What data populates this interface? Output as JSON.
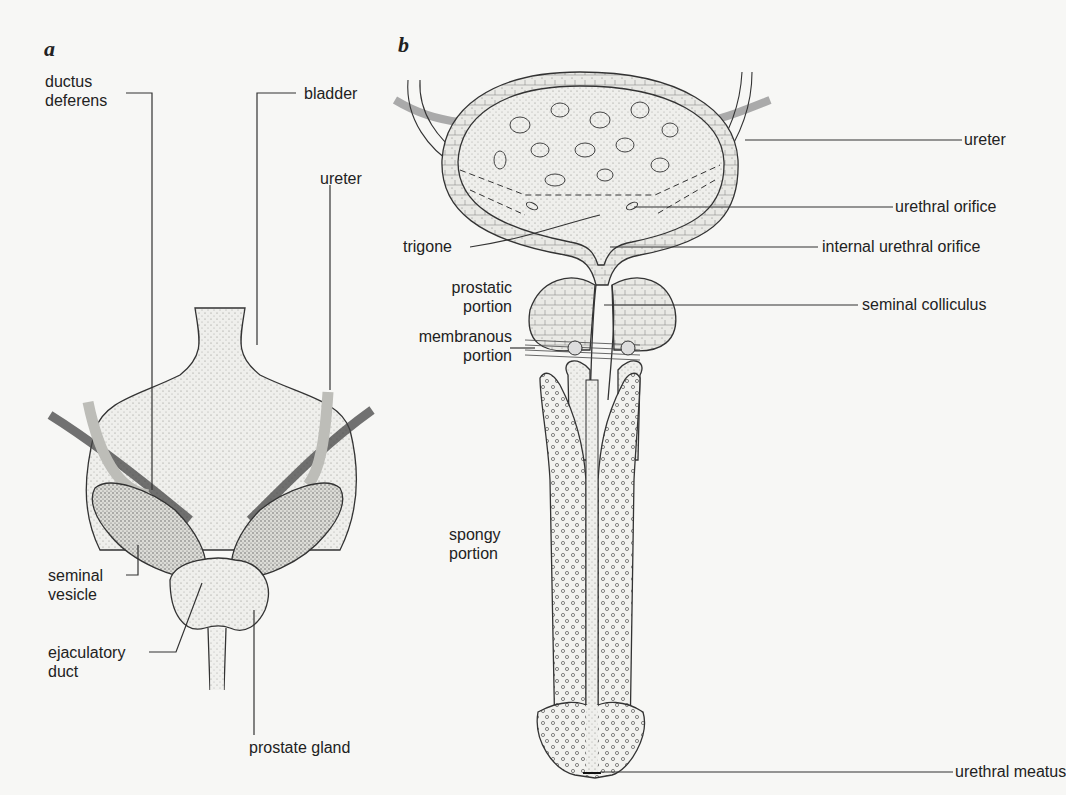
{
  "figure": {
    "panels": [
      {
        "id": "a",
        "letter": "a",
        "labels": {
          "ductus_deferens": [
            "ductus",
            "deferens"
          ],
          "bladder": "bladder",
          "ureter": "ureter",
          "seminal_vesicle": [
            "seminal",
            "vesicle"
          ],
          "ejaculatory_duct": [
            "ejaculatory",
            "duct"
          ],
          "prostate_gland": "prostate gland"
        }
      },
      {
        "id": "b",
        "letter": "b",
        "labels": {
          "ureter": "ureter",
          "urethral_orifice": "urethral orifice",
          "trigone": "trigone",
          "internal_urethral_orifice": "internal urethral orifice",
          "prostatic_portion": [
            "prostatic",
            "portion"
          ],
          "seminal_colliculus": "seminal colliculus",
          "membranous_portion": [
            "membranous",
            "portion"
          ],
          "spongy_portion": [
            "spongy",
            "portion"
          ],
          "urethral_meatus": "urethral meatus"
        }
      }
    ]
  },
  "colors": {
    "background": "#f7f7f5",
    "ink": "#333333",
    "stipple": "#e6e6e2",
    "stipple_dark": "#b9b9b4"
  }
}
